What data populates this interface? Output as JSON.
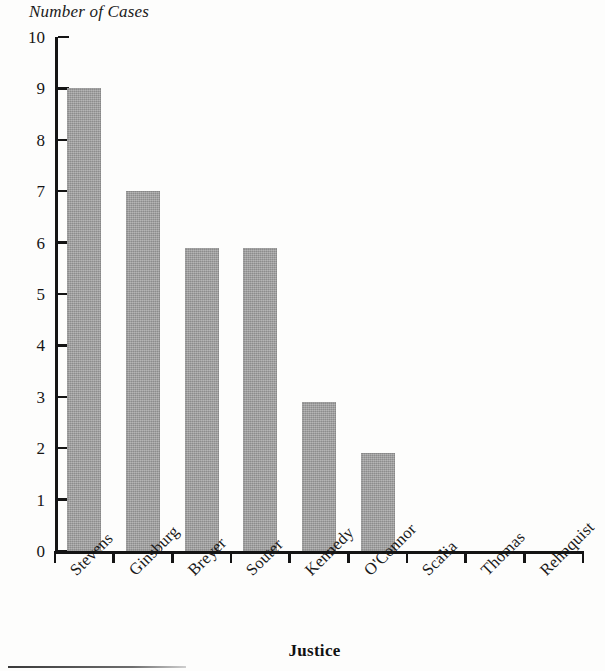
{
  "chart_data": {
    "type": "bar",
    "title": "",
    "ylabel": "Number of Cases",
    "xlabel": "Justice",
    "categories": [
      "Stevens",
      "Ginsburg",
      "Breyer",
      "Souter",
      "Kennedy",
      "O'Connor",
      "Scalia",
      "Thomas",
      "Rehnquist"
    ],
    "values": [
      9,
      7,
      5.9,
      5.9,
      2.9,
      1.9,
      0,
      0,
      0
    ],
    "ylim": [
      0,
      10
    ],
    "ytick_labels": [
      "0",
      "1",
      "2",
      "3",
      "4",
      "5",
      "6",
      "7",
      "8",
      "9",
      "10"
    ],
    "ytick_values": [
      0,
      1,
      2,
      3,
      4,
      5,
      6,
      7,
      8,
      9,
      10
    ],
    "grid": false,
    "legend": false,
    "bar_color": "#9a9a9a",
    "axis_color": "#141414",
    "xlabel_rotation": -45
  }
}
